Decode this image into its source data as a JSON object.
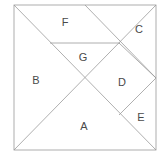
{
  "figure": {
    "name": "tangram-square-diagram",
    "background_color": "#ffffff",
    "stroke_color": "#9a9a9a",
    "label_color": "#4a4a4a",
    "stroke_width": 0.8
  },
  "square": {
    "name": "outer-square",
    "x": 14,
    "y": 5,
    "width": 142,
    "height": 145
  },
  "cut_lines": [
    {
      "name": "main-diagonal",
      "x1": 14,
      "y1": 5,
      "x2": 156,
      "y2": 150
    },
    {
      "name": "anti-diagonal",
      "x1": 14,
      "y1": 150,
      "x2": 156,
      "y2": 5
    },
    {
      "name": "top-mid-to-right-mid",
      "x1": 85,
      "y1": 5,
      "x2": 156,
      "y2": 78
    },
    {
      "name": "horizontal-cut",
      "x1": 50,
      "y1": 43,
      "x2": 120,
      "y2": 43
    },
    {
      "name": "diamond-upper-right",
      "x1": 119,
      "y1": 43,
      "x2": 156,
      "y2": 78
    },
    {
      "name": "diamond-lower-right",
      "x1": 156,
      "y1": 78,
      "x2": 119,
      "y2": 115
    }
  ],
  "labels": [
    {
      "name": "piece-label-f",
      "text": "F",
      "x": 65,
      "y": 22
    },
    {
      "name": "piece-label-c",
      "text": "C",
      "x": 139,
      "y": 29
    },
    {
      "name": "piece-label-g",
      "text": "G",
      "x": 83,
      "y": 57
    },
    {
      "name": "piece-label-b",
      "text": "B",
      "x": 36,
      "y": 80
    },
    {
      "name": "piece-label-d",
      "text": "D",
      "x": 122,
      "y": 82
    },
    {
      "name": "piece-label-a",
      "text": "A",
      "x": 84,
      "y": 126
    },
    {
      "name": "piece-label-e",
      "text": "E",
      "x": 141,
      "y": 117
    }
  ]
}
